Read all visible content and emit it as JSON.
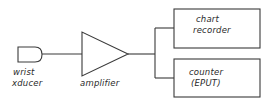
{
  "diagram": {
    "type": "block diagram",
    "blocks": {
      "transducer": {
        "line1": "wrist",
        "line2": "xducer"
      },
      "amplifier": {
        "label": "amplifier"
      },
      "chart_recorder": {
        "line1": "chart",
        "line2": "recorder"
      },
      "counter": {
        "line1": "counter",
        "line2": "(EPUT)"
      }
    },
    "connections": [
      {
        "from": "transducer",
        "to": "amplifier"
      },
      {
        "from": "amplifier",
        "to": "chart_recorder"
      },
      {
        "from": "amplifier",
        "to": "counter"
      }
    ],
    "colors": {
      "stroke": "#3a3a3a",
      "text": "#2a2a2a",
      "background": "#ffffff"
    }
  }
}
